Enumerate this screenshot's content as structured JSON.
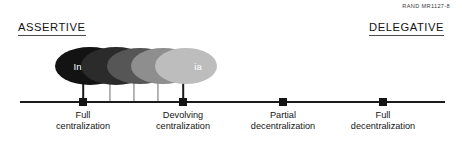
{
  "figure": {
    "source_credit": "RAND MR1127-8",
    "poles": {
      "left_label": "ASSERTIVE",
      "right_label": "DELEGATIVE"
    }
  },
  "chart_data": {
    "type": "scatter",
    "title": "",
    "subtitle": "",
    "xlabel": "",
    "ylabel": "",
    "grid": false,
    "legend_position": "none",
    "axis": {
      "left_pole": "ASSERTIVE",
      "right_pole": "DELEGATIVE",
      "x_start_px": 20,
      "x_end_px": 445
    },
    "categories": [
      "Full centralization",
      "Devolving centralization",
      "Partial decentralization",
      "Full decentralization"
    ],
    "ticks": [
      {
        "label_line1": "Full",
        "label_line2": "centralization",
        "x": 83
      },
      {
        "label_line1": "Devolving",
        "label_line2": "centralization",
        "x": 183
      },
      {
        "label_line1": "Partial",
        "label_line2": "decentralization",
        "x": 283
      },
      {
        "label_line1": "Full",
        "label_line2": "decentralization",
        "x": 383
      }
    ],
    "series": [
      {
        "name": "Cases",
        "points": [
          {
            "label": "India",
            "x": 83,
            "shade": "#131313",
            "cx": 90,
            "cy": 66,
            "rx": 35,
            "ry": 19,
            "label_dx": -6
          },
          {
            "label": "ia",
            "x": 110,
            "shade": "#2b2b2b",
            "cx": 116,
            "cy": 66,
            "rx": 35,
            "ry": 19,
            "label_dx": 14
          },
          {
            "label": "ia",
            "x": 134,
            "shade": "#565656",
            "cx": 140,
            "cy": 66,
            "rx": 33,
            "ry": 18,
            "label_dx": 14
          },
          {
            "label": "ia",
            "x": 158,
            "shade": "#8e8e8e",
            "cx": 163,
            "cy": 66,
            "rx": 32,
            "ry": 18,
            "label_dx": 14
          },
          {
            "label": "ia",
            "x": 183,
            "shade": "#bdbdbd",
            "cx": 186,
            "cy": 66,
            "rx": 31,
            "ry": 18,
            "label_dx": 12
          }
        ]
      }
    ],
    "colors": {
      "axis": "#1b1b1b",
      "tick_marker": "#141414",
      "stem": "#6d6d6d",
      "text": "#151515",
      "label_on_shape": "#ffffff"
    }
  }
}
